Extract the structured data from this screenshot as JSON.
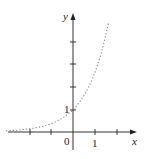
{
  "chart_data": {
    "type": "line",
    "title": "",
    "xlabel": "x",
    "ylabel": "y",
    "x_tick_labels": [
      "0",
      "1"
    ],
    "y_tick_labels": [
      "1"
    ],
    "xlim": [
      -3.2,
      2.9
    ],
    "ylim": [
      -0.5,
      5.4
    ],
    "grid": false,
    "legend": null,
    "series": [
      {
        "name": "y = e^x",
        "style": "dotted",
        "x": [
          -3.1,
          -2.5,
          -2,
          -1.5,
          -1,
          -0.5,
          0,
          0.5,
          1,
          1.5,
          2,
          2.3
        ],
        "values": [
          0.05,
          0.08,
          0.14,
          0.22,
          0.37,
          0.61,
          1.0,
          1.65,
          2.72,
          4.48,
          7.39,
          9.97
        ]
      }
    ],
    "x_ticks": [
      -2,
      -1,
      0,
      1,
      2
    ],
    "y_ticks": [
      1,
      2,
      3,
      4
    ]
  },
  "labels": {
    "x_axis": "x",
    "y_axis": "y",
    "origin": "0",
    "x_one": "1",
    "y_one": "1"
  },
  "colors": {
    "axis": "#333333",
    "curve": "#888888"
  }
}
